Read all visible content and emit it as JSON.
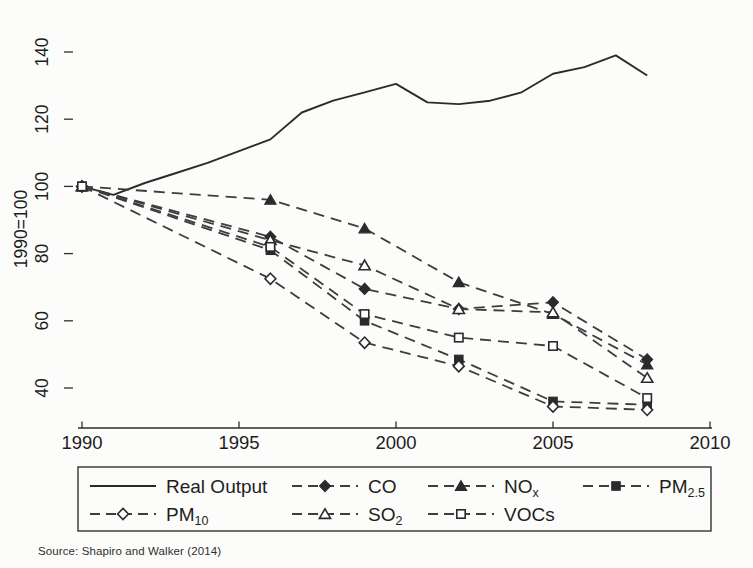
{
  "chart_data": {
    "type": "line",
    "title": "",
    "ylabel": "1990=100",
    "xlabel": "",
    "grid": false,
    "legend_position": "bottom-box",
    "xlim": [
      1990,
      2010
    ],
    "ylim": [
      28,
      145
    ],
    "x_ticks": [
      1990,
      1995,
      2000,
      2005,
      2010
    ],
    "y_ticks": [
      40,
      60,
      80,
      100,
      120,
      140
    ],
    "series": [
      {
        "name": "Real Output",
        "line": "solid",
        "marker": "none",
        "x": [
          1990,
          1991,
          1992,
          1993,
          1994,
          1995,
          1996,
          1997,
          1998,
          1999,
          2000,
          2001,
          2002,
          2003,
          2004,
          2005,
          2006,
          2007,
          2008
        ],
        "values": [
          100,
          97.5,
          101,
          104,
          107,
          110.5,
          114,
          122,
          125.5,
          128,
          130.5,
          125,
          124.5,
          125.5,
          128,
          133.5,
          135.5,
          139,
          133
        ]
      },
      {
        "name": "CO",
        "line": "dashed",
        "marker": "diamond-filled",
        "x": [
          1990,
          1996,
          1999,
          2002,
          2005,
          2008
        ],
        "values": [
          100,
          85,
          69.5,
          63.5,
          65.5,
          48.5
        ]
      },
      {
        "name": "NOx",
        "line": "dashed",
        "marker": "triangle-filled",
        "x": [
          1990,
          1996,
          1999,
          2002,
          2005,
          2008
        ],
        "values": [
          100,
          96,
          87.5,
          71.5,
          62,
          47
        ]
      },
      {
        "name": "PM2.5",
        "line": "dashed",
        "marker": "square-filled",
        "x": [
          1990,
          1996,
          1999,
          2002,
          2005,
          2008
        ],
        "values": [
          100,
          81,
          60,
          48.5,
          36,
          35
        ]
      },
      {
        "name": "PM10",
        "line": "dashed",
        "marker": "diamond-open",
        "x": [
          1990,
          1996,
          1999,
          2002,
          2005,
          2008
        ],
        "values": [
          100,
          72.5,
          53.5,
          46.5,
          34.5,
          33.5
        ]
      },
      {
        "name": "SO2",
        "line": "dashed",
        "marker": "triangle-open",
        "x": [
          1990,
          1996,
          1999,
          2002,
          2005,
          2008
        ],
        "values": [
          100,
          84,
          76.5,
          63.5,
          62.5,
          43
        ]
      },
      {
        "name": "VOCs",
        "line": "dashed",
        "marker": "square-open",
        "x": [
          1990,
          1996,
          1999,
          2002,
          2005,
          2008
        ],
        "values": [
          100,
          82,
          62,
          55,
          52.5,
          37
        ]
      }
    ],
    "source": "Source: Shapiro and Walker (2014)"
  },
  "legend": {
    "rows": [
      [
        {
          "series": "Real Output",
          "main": "Real Output",
          "sub": ""
        },
        {
          "series": "CO",
          "main": "CO",
          "sub": ""
        },
        {
          "series": "NOx",
          "main": "NO",
          "sub": "x"
        },
        {
          "series": "PM2.5",
          "main": "PM",
          "sub": "2.5"
        }
      ],
      [
        {
          "series": "PM10",
          "main": "PM",
          "sub": "10"
        },
        {
          "series": "SO2",
          "main": "SO",
          "sub": "2"
        },
        {
          "series": "VOCs",
          "main": "VOCs",
          "sub": ""
        }
      ]
    ]
  },
  "colors": {
    "ink": "#2b2b2b",
    "dash_ink": "#3d3d3d",
    "axis_ink": "#2f2f2f",
    "background": "#fcfcfa"
  }
}
